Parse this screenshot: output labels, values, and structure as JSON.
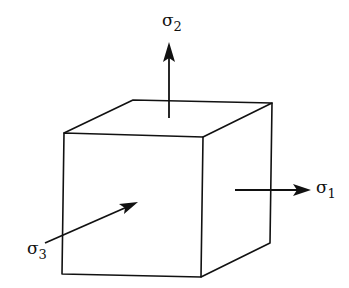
{
  "diagram": {
    "stroke_color": "#111111",
    "background": "#ffffff",
    "labels": {
      "sigma1": {
        "symbol": "σ",
        "subscript": "1"
      },
      "sigma2": {
        "symbol": "σ",
        "subscript": "2"
      },
      "sigma3": {
        "symbol": "σ",
        "subscript": "3"
      }
    }
  }
}
